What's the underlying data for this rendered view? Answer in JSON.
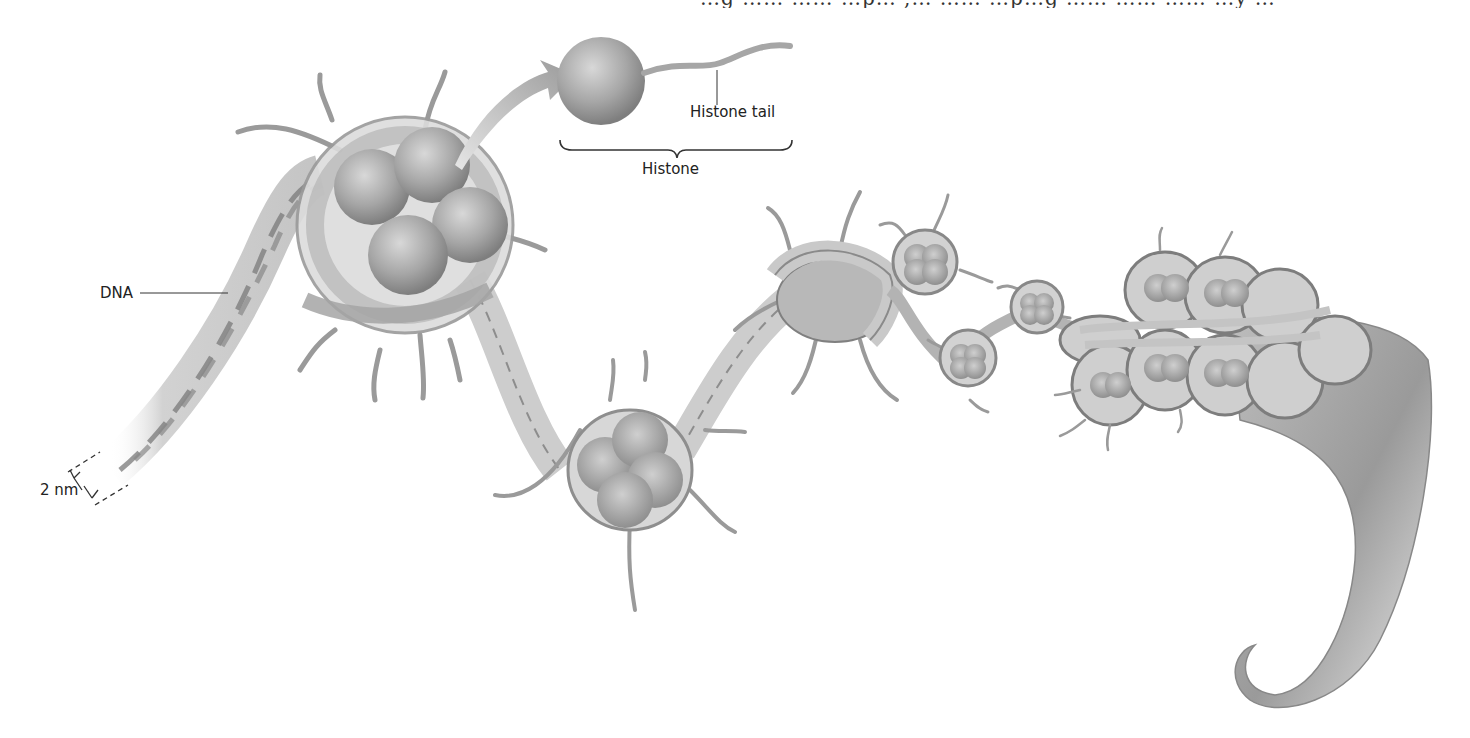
{
  "figure": {
    "top_text_clipped": "…g …… …… …p… ,… …… …p…g …… …… …… …y …"
  },
  "labels": {
    "histone_tail": "Histone tail",
    "histone": "Histone",
    "dna": "DNA",
    "scale": "2 nm"
  },
  "colors": {
    "background": "#ffffff",
    "ink": "#222222",
    "histone_fill": "#a8a8a8",
    "dna_band": "#cfcfcf",
    "dna_strand": "#7a7a7a",
    "fiber": "#8c8c8c"
  }
}
